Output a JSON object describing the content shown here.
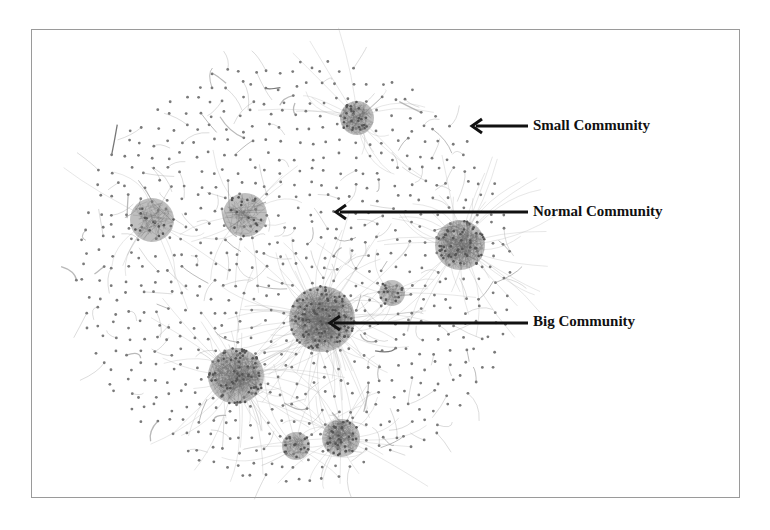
{
  "figure": {
    "type": "network-community-graph",
    "frame": {
      "x": 31,
      "y": 29,
      "width": 709,
      "height": 469,
      "border_color": "#9a9a9a"
    },
    "colors": {
      "node": "#7a7a7a",
      "edge": "#a8a8a8",
      "cluster": "#8a8a8a",
      "arrow": "#111111",
      "text": "#111111"
    },
    "annotations": [
      {
        "id": "small",
        "label": "Small Community",
        "text_x": 533,
        "text_y": 118,
        "arrow_from_x": 528,
        "arrow_to_x": 472,
        "arrow_y": 126
      },
      {
        "id": "normal",
        "label": "Normal Community",
        "text_x": 533,
        "text_y": 204,
        "arrow_from_x": 528,
        "arrow_to_x": 336,
        "arrow_y": 212
      },
      {
        "id": "big",
        "label": "Big Community",
        "text_x": 533,
        "text_y": 314,
        "arrow_from_x": 528,
        "arrow_to_x": 330,
        "arrow_y": 323
      }
    ],
    "communities": [
      {
        "name": "big",
        "cx": 322,
        "cy": 319,
        "r": 33,
        "density": 380
      },
      {
        "name": "large-lower-left",
        "cx": 236,
        "cy": 376,
        "r": 28,
        "density": 260
      },
      {
        "name": "large-right",
        "cx": 460,
        "cy": 245,
        "r": 25,
        "density": 220
      },
      {
        "name": "top-fan",
        "cx": 357,
        "cy": 118,
        "r": 17,
        "density": 110
      },
      {
        "name": "bottom-dense",
        "cx": 341,
        "cy": 438,
        "r": 19,
        "density": 140
      },
      {
        "name": "bottom-small",
        "cx": 296,
        "cy": 446,
        "r": 14,
        "density": 60
      },
      {
        "name": "left-mid",
        "cx": 152,
        "cy": 220,
        "r": 22,
        "density": 60
      },
      {
        "name": "upper-mid",
        "cx": 245,
        "cy": 215,
        "r": 22,
        "density": 70
      },
      {
        "name": "right-fan",
        "cx": 392,
        "cy": 293,
        "r": 13,
        "density": 50
      }
    ],
    "layout": {
      "center_x": 295,
      "center_y": 270,
      "radius_x": 223,
      "radius_y": 212,
      "scatter_nodes": 520
    }
  }
}
